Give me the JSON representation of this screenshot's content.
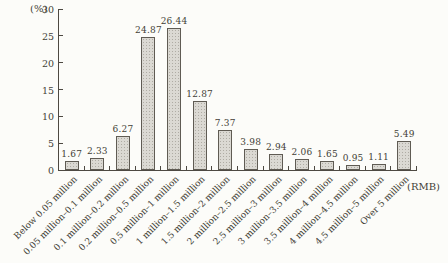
{
  "chart_data": {
    "type": "bar",
    "title": "",
    "categories": [
      "Below 0.05 million",
      "0.05 million–0.1 million",
      "0.1 million–0.2 million",
      "0.2 million–0.5 million",
      "0.5 million–1 million",
      "1 million–1.5 million",
      "1.5 million–2 million",
      "2 million–2.5 million",
      "2.5 million–3 million",
      "3 million–3.5 million",
      "3.5 million–4 million",
      "4 million–4.5 million",
      "4.5 million–5 million",
      "Over 5 million"
    ],
    "values": [
      1.67,
      2.33,
      6.27,
      24.87,
      26.44,
      12.87,
      7.37,
      3.98,
      2.94,
      2.06,
      1.65,
      0.95,
      1.11,
      5.49
    ],
    "value_labels": [
      "1.67",
      "2.33",
      "6.27",
      "24.87",
      "26.44",
      "12.87",
      "7.37",
      "3.98",
      "2.94",
      "2.06",
      "1.65",
      "0.95",
      "1.11",
      "5.49"
    ],
    "ylabel": "(%)",
    "xlabel": "(RMB)",
    "ylim": [
      0,
      30
    ],
    "y_ticks": [
      0,
      5,
      10,
      15,
      20,
      25,
      30
    ],
    "grid": false,
    "legend": "none",
    "bar_fill": "#dbd9d3",
    "bar_border": "#5f5b53",
    "axis_color": "#4d4942",
    "text_color": "#433f37"
  }
}
